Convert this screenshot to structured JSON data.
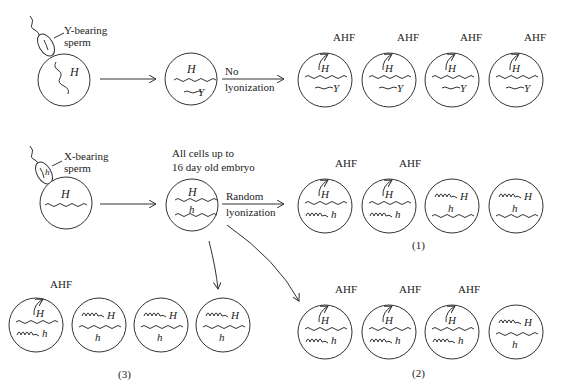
{
  "diagram": {
    "row1": {
      "sperm_label_line1": "Y-bearing",
      "sperm_label_line2": "sperm",
      "egg_gene": "H",
      "zygote_genes": [
        "H",
        "Y"
      ],
      "arrow_label_line1": "No",
      "arrow_label_line2": "lyonization",
      "product": "AHF",
      "cells": [
        {
          "top": "H",
          "bottom": "Y",
          "ahf": true
        },
        {
          "top": "H",
          "bottom": "Y",
          "ahf": true
        },
        {
          "top": "H",
          "bottom": "Y",
          "ahf": true
        },
        {
          "top": "H",
          "bottom": "Y",
          "ahf": true
        }
      ]
    },
    "row2": {
      "sperm_label_line1": "X-bearing",
      "sperm_label_line2": "sperm",
      "sperm_gene": "h",
      "egg_gene": "H",
      "zygote_caption_line1": "All cells up to",
      "zygote_caption_line2": "16 day old embryo",
      "zygote_genes": [
        "H",
        "h"
      ],
      "arrow_label_line1": "Random",
      "arrow_label_line2": "lyonization",
      "product": "AHF",
      "outcome_1": {
        "label": "(1)",
        "cells": [
          {
            "active": "H",
            "inactive": "h",
            "ahf": true
          },
          {
            "active": "H",
            "inactive": "h",
            "ahf": true
          },
          {
            "active": "h",
            "inactive": "H",
            "ahf": false
          },
          {
            "active": "h",
            "inactive": "H",
            "ahf": false
          }
        ]
      },
      "outcome_2": {
        "label": "(2)",
        "cells": [
          {
            "active": "H",
            "inactive": "h",
            "ahf": true
          },
          {
            "active": "H",
            "inactive": "h",
            "ahf": true
          },
          {
            "active": "H",
            "inactive": "h",
            "ahf": true
          },
          {
            "active": "h",
            "inactive": "H",
            "ahf": false
          }
        ]
      },
      "outcome_3": {
        "label": "(3)",
        "cells": [
          {
            "active": "H",
            "inactive": "h",
            "ahf": true
          },
          {
            "active": "h",
            "inactive": "H",
            "ahf": false
          },
          {
            "active": "h",
            "inactive": "H",
            "ahf": false
          },
          {
            "active": "h",
            "inactive": "H",
            "ahf": false
          }
        ]
      }
    }
  }
}
